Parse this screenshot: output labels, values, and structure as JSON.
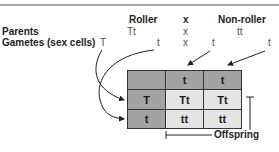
{
  "header": {
    "parent1_label": "Roller",
    "cross_symbol": "x",
    "parent2_label": "Non-roller"
  },
  "rows": {
    "parents": {
      "label": "Parents",
      "p1": "Tt",
      "x": "x",
      "p2": "tt"
    },
    "gametes": {
      "label": "Gametes (sex cells)",
      "g1": "T",
      "g2": "t",
      "x": "x",
      "g3": "t",
      "g4": "t"
    }
  },
  "punnett": {
    "col_headers": [
      "",
      "t",
      "t"
    ],
    "rows": [
      {
        "header": "T",
        "cells": [
          "Tt",
          "Tt"
        ]
      },
      {
        "header": "t",
        "cells": [
          "tt",
          "tt"
        ]
      }
    ]
  },
  "offspring_label": "Offspring",
  "colors": {
    "header_cell": "#a3a3a3",
    "offspring_cell": "#e4e4e4",
    "top_rule": "#a8a8a8"
  }
}
